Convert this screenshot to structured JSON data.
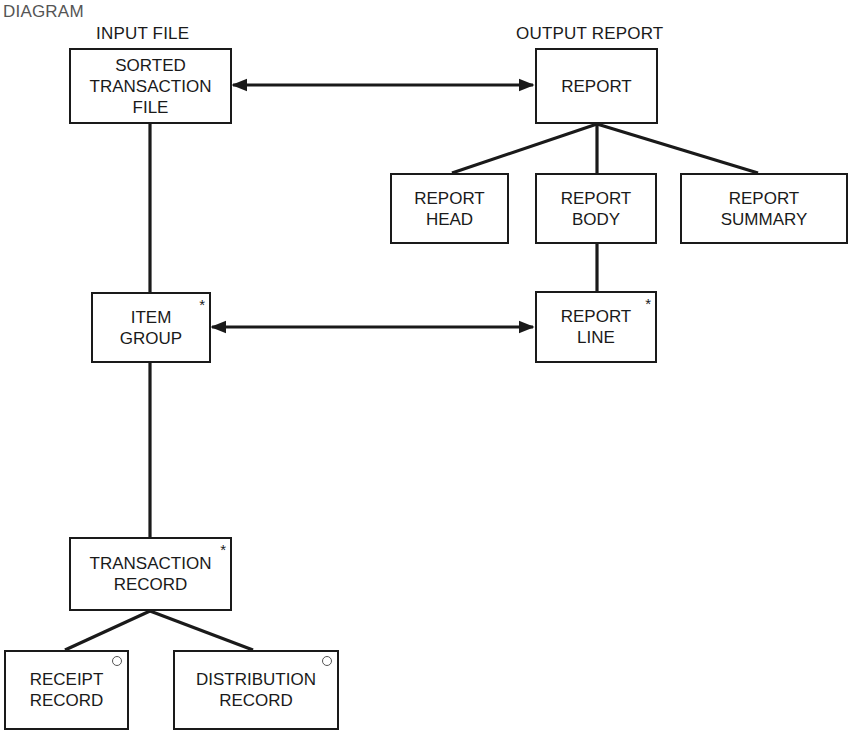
{
  "title": "DIAGRAM",
  "sections": {
    "input": "INPUT FILE",
    "output": "OUTPUT REPORT"
  },
  "nodes": {
    "sorted_transaction_file": {
      "lines": [
        "SORTED",
        "TRANSACTION",
        "FILE"
      ],
      "marker": ""
    },
    "report": {
      "lines": [
        "REPORT"
      ],
      "marker": ""
    },
    "report_head": {
      "lines": [
        "REPORT",
        "HEAD"
      ],
      "marker": ""
    },
    "report_body": {
      "lines": [
        "REPORT",
        "BODY"
      ],
      "marker": ""
    },
    "report_summary": {
      "lines": [
        "REPORT",
        "SUMMARY"
      ],
      "marker": ""
    },
    "item_group": {
      "lines": [
        "ITEM",
        "GROUP"
      ],
      "marker": "*"
    },
    "report_line": {
      "lines": [
        "REPORT",
        "LINE"
      ],
      "marker": "*"
    },
    "transaction_record": {
      "lines": [
        "TRANSACTION",
        "RECORD"
      ],
      "marker": "*"
    },
    "receipt_record": {
      "lines": [
        "RECEIPT",
        "RECORD"
      ],
      "marker": "○"
    },
    "distribution_record": {
      "lines": [
        "DISTRIBUTION",
        "RECORD"
      ],
      "marker": "○"
    }
  },
  "edges": [
    {
      "from": "sorted_transaction_file",
      "to": "item_group",
      "type": "hierarchy"
    },
    {
      "from": "item_group",
      "to": "transaction_record",
      "type": "hierarchy"
    },
    {
      "from": "transaction_record",
      "to": "receipt_record",
      "type": "hierarchy"
    },
    {
      "from": "transaction_record",
      "to": "distribution_record",
      "type": "hierarchy"
    },
    {
      "from": "report",
      "to": "report_head",
      "type": "hierarchy"
    },
    {
      "from": "report",
      "to": "report_body",
      "type": "hierarchy"
    },
    {
      "from": "report",
      "to": "report_summary",
      "type": "hierarchy"
    },
    {
      "from": "report_body",
      "to": "report_line",
      "type": "hierarchy"
    },
    {
      "from": "sorted_transaction_file",
      "to": "report",
      "type": "correspondence-bidirectional"
    },
    {
      "from": "item_group",
      "to": "report_line",
      "type": "correspondence-bidirectional"
    }
  ],
  "colors": {
    "line": "#1a1a1a",
    "background": "#ffffff",
    "circle_marker": "#555555"
  }
}
